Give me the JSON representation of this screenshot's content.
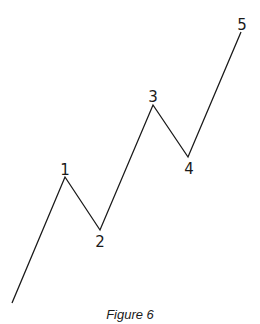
{
  "figure": {
    "caption": "Figure 6",
    "line_color": "#1a1a1a",
    "background": "#ffffff"
  },
  "waves": {
    "start": {
      "x": 12,
      "y": 303
    },
    "points": [
      {
        "label": "1",
        "x": 65,
        "y": 177,
        "label_x": 65,
        "label_y": 175,
        "label_anchor": "above"
      },
      {
        "label": "2",
        "x": 100,
        "y": 230,
        "label_x": 100,
        "label_y": 247,
        "label_anchor": "below"
      },
      {
        "label": "3",
        "x": 153,
        "y": 105,
        "label_x": 153,
        "label_y": 102,
        "label_anchor": "above"
      },
      {
        "label": "4",
        "x": 188,
        "y": 157,
        "label_x": 189,
        "label_y": 174,
        "label_anchor": "below"
      },
      {
        "label": "5",
        "x": 241,
        "y": 32,
        "label_x": 242,
        "label_y": 30,
        "label_anchor": "above"
      }
    ]
  },
  "chart_data": {
    "type": "line",
    "title": "Figure 6",
    "x": [
      0,
      1,
      2,
      3,
      4,
      5
    ],
    "labels": [
      "",
      "1",
      "2",
      "3",
      "4",
      "5"
    ],
    "values": [
      0,
      126,
      73,
      198,
      146,
      271
    ],
    "xlabel": "",
    "ylabel": "",
    "grid": false,
    "legend": null
  }
}
